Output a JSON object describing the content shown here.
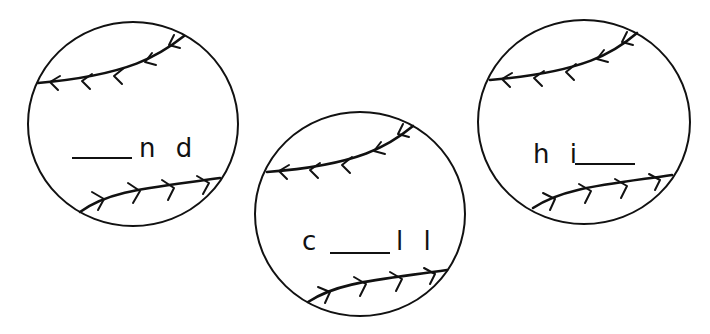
{
  "worksheet": {
    "balls": [
      {
        "name": "ball-1",
        "prefix": "",
        "suffix": "n d",
        "blank_position": "start"
      },
      {
        "name": "ball-2",
        "prefix": "c",
        "suffix": "l l",
        "blank_position": "middle"
      },
      {
        "name": "ball-3",
        "prefix": "h i",
        "suffix": "",
        "blank_position": "end"
      }
    ],
    "colors": {
      "ink": "#111111",
      "background": "#ffffff"
    },
    "icon": "baseball-icon"
  }
}
